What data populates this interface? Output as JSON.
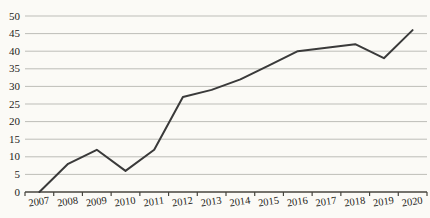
{
  "chart_data": {
    "type": "line",
    "title": "",
    "xlabel": "",
    "ylabel": "",
    "categories": [
      "2007",
      "2008",
      "2009",
      "2010",
      "2011",
      "2012",
      "2013",
      "2014",
      "2015",
      "2016",
      "2017",
      "2018",
      "2019",
      "2020"
    ],
    "values": [
      0,
      8,
      12,
      6,
      12,
      27,
      29,
      32,
      36,
      40,
      41,
      42,
      38,
      46
    ],
    "ylim": [
      0,
      50
    ],
    "yticks": [
      0,
      5,
      10,
      15,
      20,
      25,
      30,
      35,
      40,
      45,
      50
    ],
    "grid": true,
    "legend": "none",
    "colors": {
      "line": "#3a3a3a",
      "grid": "#bdbdb8",
      "axis": "#47453e",
      "labels": "#1d1c18",
      "background": "#fbfaf6"
    }
  }
}
